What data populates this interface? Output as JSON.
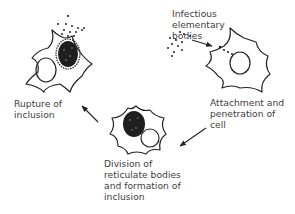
{
  "diagram": {
    "labels": {
      "infectious": [
        "Infectious",
        "elementary",
        "bodies"
      ],
      "attachment": [
        "Attachment and",
        "penetration of",
        "cell"
      ],
      "division": [
        "Division of",
        "reticulate bodies",
        "and formation of",
        "inclusion"
      ],
      "rupture": [
        "Rupture of",
        "inclusion"
      ]
    },
    "colors": {
      "ink": "#222222",
      "text": "#3d3d3d",
      "background": "#ffffff"
    }
  }
}
